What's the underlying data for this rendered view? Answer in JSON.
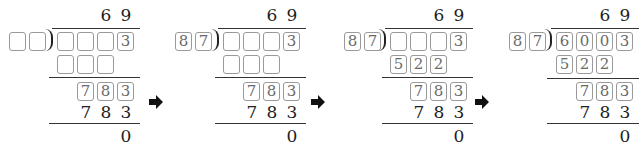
{
  "problem": {
    "quotient": [
      "6",
      "9"
    ],
    "divisor": [
      "8",
      "7"
    ],
    "dividend": [
      "6",
      "0",
      "0",
      "3"
    ],
    "first_product": [
      "5",
      "2",
      "2"
    ],
    "remainder_row": [
      "7",
      "8",
      "3"
    ],
    "second_product": [
      "7",
      "8",
      "3"
    ],
    "final_remainder": "0"
  },
  "panels": [
    {
      "quotient": [
        "6",
        "9"
      ],
      "divisor": [
        "",
        ""
      ],
      "dividend": [
        "",
        "",
        "",
        "3"
      ],
      "first_product": [
        "",
        "",
        ""
      ],
      "remainder_row": [
        "7",
        "8",
        "3"
      ],
      "second_product": [
        "7",
        "8",
        "3"
      ],
      "final_remainder": "0"
    },
    {
      "quotient": [
        "6",
        "9"
      ],
      "divisor": [
        "8",
        "7"
      ],
      "dividend": [
        "",
        "",
        "",
        "3"
      ],
      "first_product": [
        "",
        "",
        ""
      ],
      "remainder_row": [
        "7",
        "8",
        "3"
      ],
      "second_product": [
        "7",
        "8",
        "3"
      ],
      "final_remainder": "0"
    },
    {
      "quotient": [
        "6",
        "9"
      ],
      "divisor": [
        "8",
        "7"
      ],
      "dividend": [
        "",
        "",
        "",
        "3"
      ],
      "first_product": [
        "5",
        "2",
        "2"
      ],
      "remainder_row": [
        "7",
        "8",
        "3"
      ],
      "second_product": [
        "7",
        "8",
        "3"
      ],
      "final_remainder": "0"
    },
    {
      "quotient": [
        "6",
        "9"
      ],
      "divisor": [
        "8",
        "7"
      ],
      "dividend": [
        "6",
        "0",
        "0",
        "3"
      ],
      "first_product": [
        "5",
        "2",
        "2"
      ],
      "remainder_row": [
        "7",
        "8",
        "3"
      ],
      "second_product": [
        "7",
        "8",
        "3"
      ],
      "final_remainder": "0"
    }
  ],
  "arrows": [
    "right-arrow",
    "right-arrow",
    "right-arrow"
  ],
  "colors": {
    "box_border": "#9a9a9a",
    "box_text": "#6a6a6a",
    "text": "#1e1e1e",
    "line": "#333333"
  }
}
